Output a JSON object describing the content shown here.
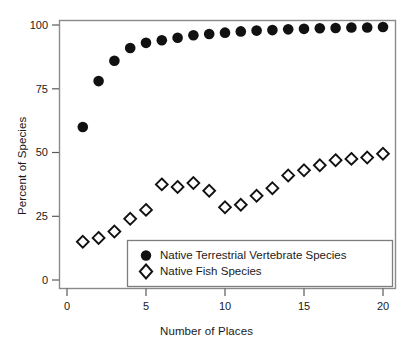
{
  "figure": {
    "title": "",
    "xlabel": "Number of Places",
    "ylabel": "Percent of Species"
  },
  "axes": {
    "yticks": [
      "0",
      "25",
      "50",
      "75",
      "100"
    ],
    "xticks": [
      "0",
      "5",
      "10",
      "15",
      "20"
    ]
  },
  "legend": {
    "entries": [
      {
        "label": "Native Terrestrial Vertebrate Species",
        "marker": "filled-circle-marker",
        "color": "#000000"
      },
      {
        "label": "Native Fish Species",
        "marker": "open-diamond-marker",
        "color": "#000000"
      }
    ]
  },
  "caption": "",
  "chart_data": {
    "type": "scatter",
    "title": "",
    "xlabel": "Number of Places",
    "ylabel": "Percent of Species",
    "xlim": [
      0,
      20.6
    ],
    "ylim": [
      0,
      105
    ],
    "grid": false,
    "legend_position": "inside-bottom-center",
    "x": [
      1,
      2,
      3,
      4,
      5,
      6,
      7,
      8,
      9,
      10,
      11,
      12,
      13,
      14,
      15,
      16,
      17,
      18,
      19,
      20
    ],
    "series": [
      {
        "name": "Native Terrestrial Vertebrate Species",
        "marker": "filled-circle",
        "color": "#000000",
        "values": [
          60,
          78,
          86,
          91,
          93,
          94,
          95,
          96,
          96.5,
          97,
          97.5,
          97.8,
          98,
          98.3,
          98.5,
          98.7,
          98.8,
          99,
          99,
          99.2
        ]
      },
      {
        "name": "Native Fish Species",
        "marker": "open-diamond",
        "color": "#ffffff",
        "values": [
          15,
          16.5,
          19,
          24,
          27.5,
          37.5,
          36.5,
          38,
          35,
          28.5,
          29.5,
          33,
          36,
          41,
          43,
          45,
          47,
          47.5,
          48,
          49.5
        ]
      }
    ]
  }
}
